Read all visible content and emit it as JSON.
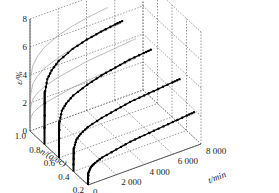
{
  "chart_data": {
    "type": "line",
    "projection": "3d",
    "title": "",
    "xlabel": "t/min",
    "ylabel": "n/(q/σc)",
    "zlabel": "ε/%",
    "x_ticks": [
      "0",
      "2 000",
      "4 000",
      "6 000",
      "8 000"
    ],
    "y_ticks": [
      "0.2",
      "0.4",
      "0.6",
      "0.8",
      "1.0"
    ],
    "z_ticks": [
      "0",
      "2",
      "4",
      "6",
      "8"
    ],
    "xlim": [
      0,
      8000
    ],
    "ylim": [
      0.2,
      1.0
    ],
    "zlim": [
      0,
      8
    ],
    "grid": true,
    "series": [
      {
        "name": "n=0.2",
        "n": 0.2,
        "t": [
          0,
          50,
          200,
          500,
          1000,
          2000,
          3000,
          4000,
          5000,
          6000,
          7000,
          7500
        ],
        "strain": [
          0.2,
          0.9,
          1.2,
          1.4,
          1.6,
          1.8,
          2.0,
          2.1,
          2.2,
          2.3,
          2.4,
          2.45
        ]
      },
      {
        "name": "n=0.4",
        "n": 0.4,
        "t": [
          0,
          50,
          200,
          500,
          1000,
          2000,
          3000,
          4000,
          5000,
          6000,
          7000,
          7500
        ],
        "strain": [
          0.5,
          1.7,
          2.2,
          2.5,
          2.8,
          3.1,
          3.3,
          3.5,
          3.6,
          3.7,
          3.8,
          3.85
        ]
      },
      {
        "name": "n=0.6",
        "n": 0.6,
        "t": [
          0,
          50,
          200,
          500,
          1000,
          2000,
          3000,
          4000,
          5000,
          6000,
          6500
        ],
        "strain": [
          0.8,
          2.6,
          3.3,
          3.7,
          4.1,
          4.5,
          4.8,
          5.0,
          5.2,
          5.3,
          5.35
        ]
      },
      {
        "name": "n=0.8",
        "n": 0.8,
        "t": [
          0,
          50,
          200,
          500,
          1000,
          2000,
          3000,
          4000,
          5000,
          5500
        ],
        "strain": [
          1.2,
          3.8,
          4.6,
          5.1,
          5.6,
          6.1,
          6.4,
          6.6,
          6.75,
          6.8
        ]
      }
    ],
    "projected_curves_on_back_wall": true
  }
}
